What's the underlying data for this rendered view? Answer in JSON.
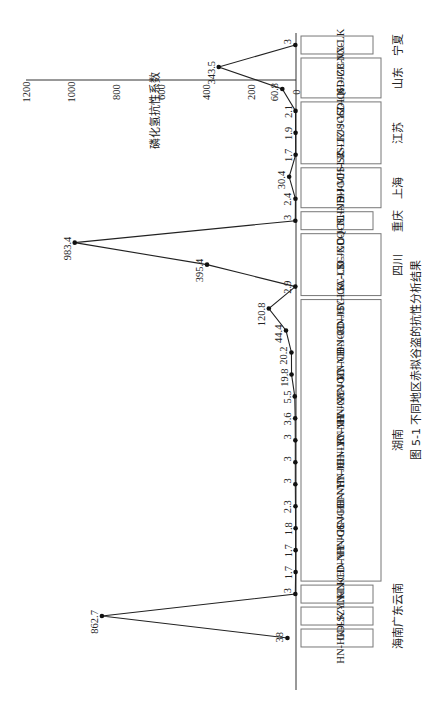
{
  "figure": {
    "caption": "图 5-1  不同地区赤拟谷盗的抗性分析结果",
    "rotation": "90deg clockwise (page rotated)"
  },
  "chart_data": {
    "type": "line",
    "title": "图 5-1 不同地区赤拟谷盗的抗性分析结果",
    "xlabel": "",
    "ylabel": "磷化氢抗性系数",
    "ylim": [
      0,
      1200
    ],
    "yticks": [
      0,
      200,
      400,
      600,
      800,
      1000,
      1200
    ],
    "grid": false,
    "legend": null,
    "categories": [
      "HN-HK-LK",
      "GD-SZ-LK",
      "YN-LK",
      "HN-CD-NH",
      "HN-YY-JGC",
      "HN-CS-JGC",
      "HN-HH-NH",
      "HN-YY-JC",
      "HN-HH-LK",
      "HN-YY-NH",
      "HN-HY-JGC",
      "HN-XY-JGC",
      "HN-XY-NH",
      "HN-CD-JGC",
      "HN-CD-JC",
      "HN-HY-LK",
      "SC-GA-LK",
      "SC-CD-JGC",
      "SC-XD-JGC",
      "CQ-TL-NH",
      "SH-JD-JGC",
      "SH-MH-LK",
      "JS-SZ-LK",
      "JS-TZ-JGC",
      "JS-YZ-LK",
      "SD-QH-JGC",
      "SD-ZB-JGC",
      "NX-LK"
    ],
    "values": [
      38,
      862.7,
      3,
      1.7,
      1.7,
      1.8,
      2.3,
      3,
      3,
      3,
      3.6,
      5.5,
      19.8,
      20.2,
      44.4,
      120.8,
      2.9,
      395.4,
      983.4,
      3,
      2.4,
      30.4,
      1.7,
      1.9,
      2.1,
      60.8,
      343.5,
      3
    ],
    "value_labels": [
      "38",
      "862.7",
      "3",
      "1.7",
      "1.7",
      "1.8",
      "2.3",
      "3",
      "3",
      "3",
      "3.6",
      "5.5",
      "19.8",
      "20.2",
      "44.4",
      "120.8",
      "2.9",
      "395.4",
      "983.4",
      "3",
      "2.4",
      "30.4",
      "1.7",
      "1.9",
      "2.1",
      "60.8",
      "343.5",
      "3"
    ],
    "groups": [
      {
        "region": "海南",
        "start": 0,
        "end": 0
      },
      {
        "region": "广东",
        "start": 1,
        "end": 1
      },
      {
        "region": "云南",
        "start": 2,
        "end": 2
      },
      {
        "region": "湖南",
        "start": 3,
        "end": 15
      },
      {
        "region": "四川",
        "start": 16,
        "end": 18
      },
      {
        "region": "重庆",
        "start": 19,
        "end": 19
      },
      {
        "region": "上海",
        "start": 20,
        "end": 21
      },
      {
        "region": "江苏",
        "start": 22,
        "end": 24
      },
      {
        "region": "山东",
        "start": 25,
        "end": 26
      },
      {
        "region": "宁夏",
        "start": 27,
        "end": 27
      }
    ]
  }
}
